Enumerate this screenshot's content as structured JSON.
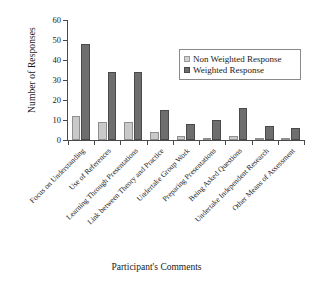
{
  "chart_data": {
    "type": "bar",
    "title": "",
    "xlabel": "Participant's Comments",
    "ylabel": "Number of Responses",
    "ylim": [
      0,
      60
    ],
    "yticks": [
      0,
      10,
      20,
      30,
      40,
      50,
      60
    ],
    "grid": false,
    "legend_position": "upper-right",
    "categories": [
      "Focus on Understanding",
      "Use of References",
      "Learning Through Presentations",
      "Link between Theory and Practice",
      "Undertake Group Work",
      "Preparing Presentations",
      "Being Asked Questions",
      "Undertake Independent Research",
      "Other Means of Assessment"
    ],
    "series": [
      {
        "name": "Non Weighted Response",
        "color": "#c9c9c9",
        "values": [
          12,
          9,
          9,
          4,
          2,
          1,
          2,
          1,
          1
        ]
      },
      {
        "name": "Weighted Response",
        "color": "#6e6e6e",
        "values": [
          48,
          34,
          34,
          15,
          8,
          10,
          16,
          7,
          6
        ]
      }
    ]
  },
  "legend": {
    "entries": [
      {
        "label": "Non Weighted Response"
      },
      {
        "label": "Weighted Response"
      }
    ]
  },
  "axis": {
    "y_title": "Number of Responses",
    "x_title": "Participant's Comments",
    "y_tick_labels": [
      "0",
      "10",
      "20",
      "30",
      "40",
      "50",
      "60"
    ]
  }
}
